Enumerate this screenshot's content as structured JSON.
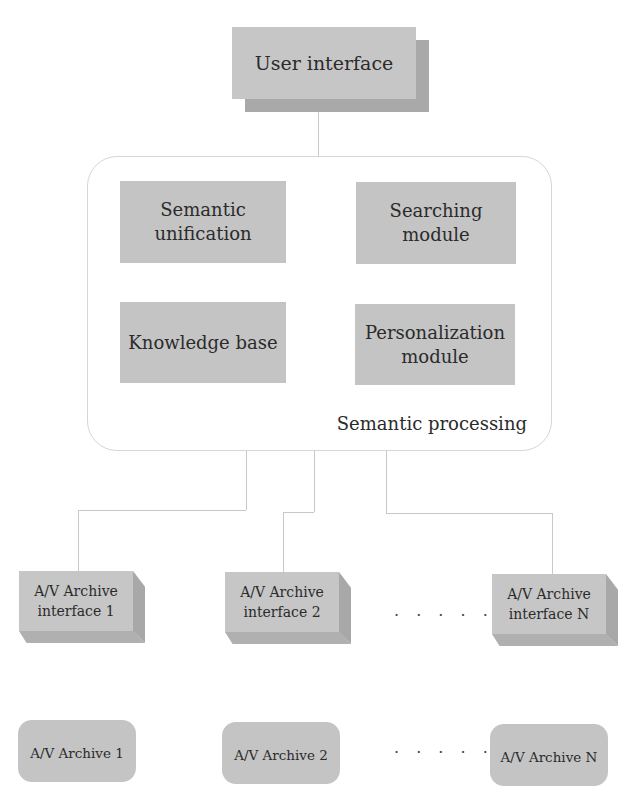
{
  "diagram": {
    "top": {
      "label": "User interface"
    },
    "container": {
      "label": "Semantic processing",
      "modules": [
        {
          "label": "Semantic\nunification",
          "line1": "Semantic",
          "line2": "unification"
        },
        {
          "label": "Searching\nmodule",
          "line1": "Searching",
          "line2": "module"
        },
        {
          "label": "Knowledge base",
          "line1": "Knowledge base",
          "line2": ""
        },
        {
          "label": "Personalization\nmodule",
          "line1": "Personalization",
          "line2": "module"
        }
      ]
    },
    "interfaces": [
      {
        "line1": "A/V Archive",
        "line2": "interface 1"
      },
      {
        "line1": "A/V Archive",
        "line2": "interface 2"
      },
      {
        "line1": "A/V Archive",
        "line2": "interface N"
      }
    ],
    "archives": [
      {
        "label": "A/V Archive 1"
      },
      {
        "label": "A/V Archive 2"
      },
      {
        "label": "A/V Archive N"
      }
    ],
    "ellipsis": "· · · · ·",
    "colors": {
      "box_fill": "#c6c6c6",
      "box_shadow": "#a9a9a9",
      "connector": "#c8c8c8",
      "container_border": "#d6d6d6"
    }
  }
}
